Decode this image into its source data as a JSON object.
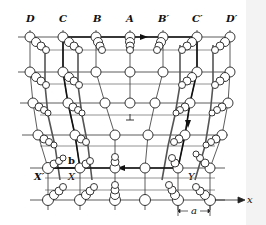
{
  "figure": {
    "type": "crystal-lattice-edge-dislocation",
    "column_labels": [
      "D",
      "C",
      "B",
      "A",
      "B′",
      "C′",
      "D′"
    ],
    "point_labels": {
      "x_prime": "X′",
      "x": "X",
      "y": "Y",
      "burgers_vector": "b",
      "spacing": "a",
      "axis": "x"
    },
    "dislocation_symbol": "⊥",
    "colors": {
      "line": "#222222",
      "atom_fill": "#ffffff",
      "atom_stroke": "#222222",
      "circuit": "#111111",
      "background": "#ffffff"
    }
  }
}
